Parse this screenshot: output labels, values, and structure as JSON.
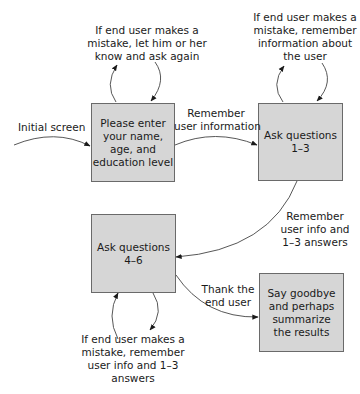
{
  "diagram": {
    "type": "flowchart",
    "nodes": [
      {
        "id": "enter-info",
        "lines": [
          "Please enter",
          "your name,",
          "age, and",
          "education level"
        ]
      },
      {
        "id": "ask-1-3",
        "lines": [
          "Ask questions",
          "1–3"
        ]
      },
      {
        "id": "ask-4-6",
        "lines": [
          "Ask questions",
          "4–6"
        ]
      },
      {
        "id": "goodbye",
        "lines": [
          "Say goodbye",
          "and perhaps",
          "summarize",
          "the results"
        ]
      }
    ],
    "edges": [
      {
        "id": "initial",
        "lines": [
          "Initial screen"
        ]
      },
      {
        "id": "enter-to-ask13",
        "lines": [
          "Remember",
          "user information"
        ]
      },
      {
        "id": "ask13-to-ask46",
        "lines": [
          "Remember",
          "user info and",
          "1–3 answers"
        ]
      },
      {
        "id": "ask46-to-goodbye",
        "lines": [
          "Thank the",
          "end user"
        ]
      },
      {
        "id": "loop-enter",
        "lines": [
          "If end user makes a",
          "mistake, let him or her",
          "know and ask again"
        ]
      },
      {
        "id": "loop-ask13",
        "lines": [
          "If end user makes a",
          "mistake, remember",
          "information about",
          "the user"
        ]
      },
      {
        "id": "loop-ask46",
        "lines": [
          "If end user makes a",
          "mistake, remember",
          "user info and 1–3",
          "answers"
        ]
      }
    ]
  },
  "colors": {
    "box_fill": "#d6d6d6",
    "box_border": "#6a6a6a",
    "line": "#333333"
  }
}
